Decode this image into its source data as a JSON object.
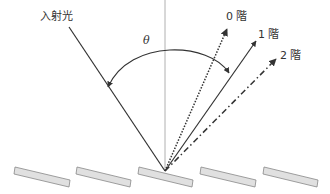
{
  "diagram": {
    "labels": {
      "incident": "入射光",
      "theta": "θ",
      "order0": "0 階",
      "order1": "1 階",
      "order2": "2 階"
    },
    "colors": {
      "line": "#333333",
      "normal": "#b0b0b0",
      "facet_fill": "#e0e0e0",
      "facet_stroke": "#888888"
    },
    "grating": {
      "facet_count": 5
    }
  }
}
